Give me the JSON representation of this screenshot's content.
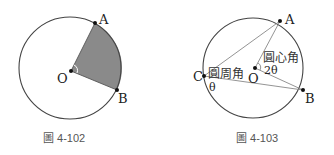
{
  "figures": [
    {
      "id": "fig-4-102",
      "caption": "圖 4-102",
      "circle": {
        "cx": 70,
        "cy": 68,
        "r": 51
      },
      "points": {
        "A": {
          "label": "A",
          "x": 95,
          "y": 23
        },
        "B": {
          "label": "B",
          "x": 117,
          "y": 90
        },
        "O": {
          "label": "O",
          "x": 71,
          "y": 71
        }
      },
      "sector_fill": "#8a8a8a"
    },
    {
      "id": "fig-4-103",
      "caption": "圖 4-103",
      "circle": {
        "cx": 253,
        "cy": 68,
        "r": 50
      },
      "points": {
        "A": {
          "label": "A",
          "x": 280,
          "y": 21
        },
        "B": {
          "label": "B",
          "x": 303,
          "y": 90
        },
        "C": {
          "label": "C",
          "x": 204,
          "y": 76
        },
        "O": {
          "label": "O",
          "x": 255,
          "y": 68
        }
      },
      "labels": {
        "central_angle": "圓心角",
        "inscribed_angle": "圓周角",
        "central_value": "2θ",
        "inscribed_value": "θ"
      }
    }
  ],
  "colors": {
    "stroke": "#444444",
    "chord": "#888888",
    "point": "#111111"
  }
}
